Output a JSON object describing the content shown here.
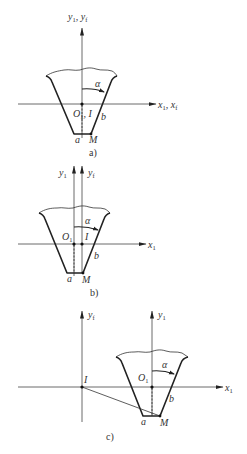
{
  "figure": {
    "panels": [
      {
        "id": "a",
        "caption": "a)",
        "axis_y_label": "y",
        "axis_y_sub": "1",
        "axis_y_label2": "y",
        "axis_y_sub2": "f",
        "axis_x_label": "x",
        "axis_x_sub": "1",
        "axis_x_label2": "x",
        "axis_x_sub2": "f",
        "origin_label": "O",
        "origin_sub": "1",
        "pitch_point_label": "I",
        "angle_label": "α",
        "point_a": "a",
        "point_b": "b",
        "point_M": "M"
      },
      {
        "id": "b",
        "caption": "b)",
        "axis_y1_label": "y",
        "axis_y1_sub": "1",
        "axis_yf_label": "y",
        "axis_yf_sub": "f",
        "axis_x_label": "x",
        "axis_x_sub": "1",
        "origin_label": "O",
        "origin_sub": "1",
        "pitch_point_label": "I",
        "angle_label": "α",
        "point_a": "a",
        "point_b": "b",
        "point_M": "M"
      },
      {
        "id": "c",
        "caption": "c)",
        "axis_yf_label": "y",
        "axis_yf_sub": "f",
        "axis_y1_label": "y",
        "axis_y1_sub": "1",
        "axis_x_label": "x",
        "axis_x_sub": "1",
        "origin_label": "O",
        "origin_sub": "1",
        "pitch_point_label": "I",
        "angle_label": "α",
        "point_a": "a",
        "point_b": "b",
        "point_M": "M"
      }
    ],
    "colors": {
      "line": "#222222",
      "axis": "#444444",
      "text": "#333333",
      "background": "#ffffff"
    }
  }
}
